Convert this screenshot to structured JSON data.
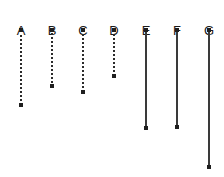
{
  "figure": {
    "background_color": "#ffffff",
    "line_color": "#3a3a3a",
    "dot_color": "#1f1f1f",
    "label_color": "#1a1a1a",
    "width": 224,
    "height": 177
  },
  "chart_data": {
    "type": "line",
    "title": "",
    "xlabel": "",
    "ylabel": "",
    "categories": [
      "A",
      "B",
      "C",
      "D",
      "E",
      "F",
      "G"
    ],
    "series": [
      {
        "name": "segment top (y px)",
        "values": [
          30,
          30,
          30,
          30,
          30,
          30,
          30
        ]
      },
      {
        "name": "segment bottom (y px)",
        "values": [
          105,
          86,
          92,
          76,
          128,
          127,
          167
        ]
      },
      {
        "name": "segment length (px)",
        "values": [
          75,
          56,
          62,
          46,
          98,
          97,
          137
        ]
      }
    ],
    "grid": false,
    "legend": "none"
  },
  "columns": [
    {
      "label": "A",
      "style": "dotted",
      "x": 21,
      "label_y": 24,
      "top": 30,
      "bottom": 105,
      "length": 75
    },
    {
      "label": "B",
      "style": "dotted",
      "x": 52,
      "label_y": 24,
      "top": 30,
      "bottom": 86,
      "length": 56
    },
    {
      "label": "C",
      "style": "dotted",
      "x": 83,
      "label_y": 24,
      "top": 30,
      "bottom": 92,
      "length": 62
    },
    {
      "label": "D",
      "style": "dotted",
      "x": 114,
      "label_y": 24,
      "top": 30,
      "bottom": 76,
      "length": 46
    },
    {
      "label": "E",
      "style": "solid",
      "x": 146,
      "label_y": 24,
      "top": 30,
      "bottom": 128,
      "length": 98
    },
    {
      "label": "F",
      "style": "solid",
      "x": 177,
      "label_y": 24,
      "top": 30,
      "bottom": 127,
      "length": 97
    },
    {
      "label": "G",
      "style": "solid",
      "x": 209,
      "label_y": 24,
      "top": 30,
      "bottom": 167,
      "length": 137
    }
  ]
}
